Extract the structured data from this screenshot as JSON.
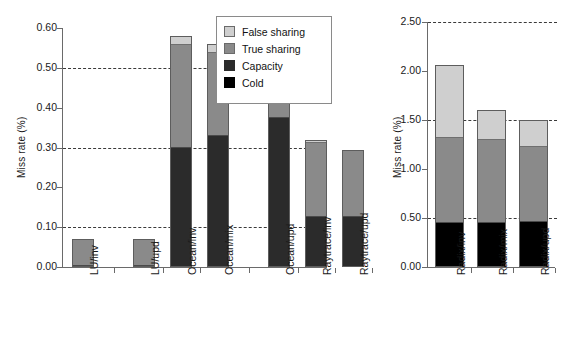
{
  "legend": {
    "items": [
      {
        "key": "false-sharing",
        "label": "False sharing",
        "color": "#cfcfcf"
      },
      {
        "key": "true-sharing",
        "label": "True sharing",
        "color": "#8a8a8a"
      },
      {
        "key": "capacity",
        "label": "Capacity",
        "color": "#2b2b2b"
      },
      {
        "key": "cold",
        "label": "Cold",
        "color": "#000000"
      }
    ]
  },
  "chart_data": [
    {
      "type": "bar",
      "id": "left-chart",
      "stacked": true,
      "title": "",
      "xlabel": "",
      "ylabel": "Miss rate (%)",
      "ylim": [
        0.0,
        0.6
      ],
      "yticks": [
        "0.00",
        "0.10",
        "0.20",
        "0.30",
        "0.40",
        "0.50",
        "0.60"
      ],
      "ytick_values": [
        0.0,
        0.1,
        0.2,
        0.3,
        0.4,
        0.5,
        0.6
      ],
      "gridlines": [
        0.1,
        0.3,
        0.5
      ],
      "grid": "dashed-horizontal",
      "legend_position": "inside-top-right",
      "categories": [
        "LU/inv",
        "LU/upd",
        "Ocean/inv",
        "Ocean/mix",
        "Ocean/upd",
        "Raytrace/inv",
        "Raytrace/upd"
      ],
      "group_gaps_after": [
        1,
        4
      ],
      "series": [
        {
          "name": "Cold",
          "values": [
            0.0,
            0.0,
            0.0,
            0.0,
            0.0,
            0.0,
            0.0
          ]
        },
        {
          "name": "Capacity",
          "values": [
            0.0,
            0.0,
            0.3,
            0.33,
            0.375,
            0.125,
            0.125
          ]
        },
        {
          "name": "True sharing",
          "values": [
            0.07,
            0.07,
            0.26,
            0.21,
            0.055,
            0.19,
            0.17
          ]
        },
        {
          "name": "False sharing",
          "values": [
            0.0,
            0.0,
            0.02,
            0.02,
            0.012,
            0.005,
            0.0
          ]
        }
      ],
      "totals": [
        0.07,
        0.07,
        0.58,
        0.56,
        0.442,
        0.32,
        0.295
      ]
    },
    {
      "type": "bar",
      "id": "right-chart",
      "stacked": true,
      "title": "",
      "xlabel": "",
      "ylabel": "Miss rate (%)",
      "ylim": [
        0.0,
        2.5
      ],
      "yticks": [
        "0.00",
        "0.50",
        "1.00",
        "1.50",
        "2.00",
        "2.50"
      ],
      "ytick_values": [
        0.0,
        0.5,
        1.0,
        1.5,
        2.0,
        2.5
      ],
      "gridlines": [
        0.5,
        1.5,
        2.5
      ],
      "grid": "dashed-horizontal",
      "legend_position": "none",
      "categories": [
        "Radix/inv",
        "Radix/mix",
        "Radix/upd"
      ],
      "group_gaps_after": [],
      "series": [
        {
          "name": "Cold",
          "values": [
            0.44,
            0.44,
            0.45
          ]
        },
        {
          "name": "Capacity",
          "values": [
            0.0,
            0.0,
            0.0
          ]
        },
        {
          "name": "True sharing",
          "values": [
            0.88,
            0.86,
            0.78
          ]
        },
        {
          "name": "False sharing",
          "values": [
            0.74,
            0.3,
            0.27
          ]
        }
      ],
      "totals": [
        2.06,
        1.6,
        1.5
      ]
    }
  ]
}
